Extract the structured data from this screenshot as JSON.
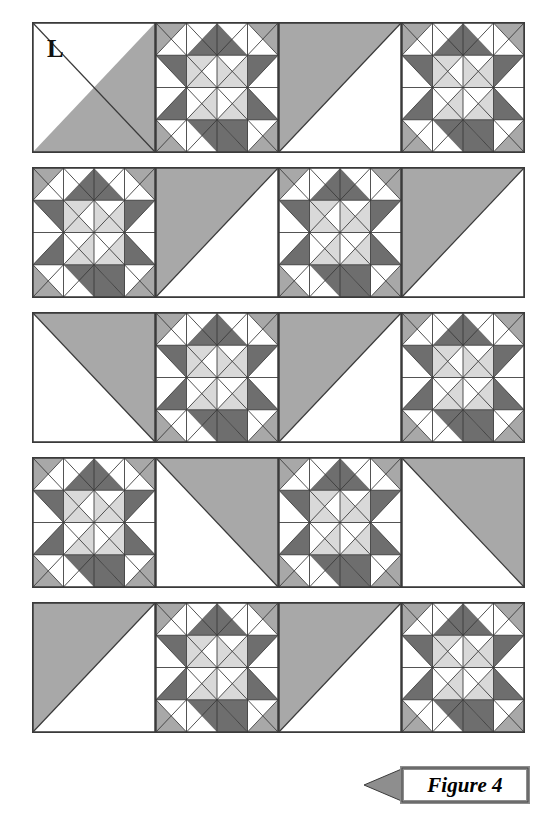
{
  "figure": {
    "caption": "Figure 4",
    "corner_label": "L",
    "banner_shape": "left-pointing-arrow-banner"
  },
  "palette": {
    "white": "#ffffff",
    "light_gray": "#d9d9d9",
    "medium_gray": "#a8a8a8",
    "dark_gray": "#6e6e6e",
    "outline": "#3a3a3a",
    "paper": "#ffffff",
    "ink": "#111111"
  },
  "quilt": {
    "rows": 5,
    "cells_per_row": 4,
    "cell_names": [
      "half-square-triangle-panel",
      "star-block"
    ],
    "layout": [
      [
        {
          "type": "triangle",
          "variant": "gray-bottom-left",
          "label": "L"
        },
        {
          "type": "star",
          "variant": "standard",
          "label": ""
        },
        {
          "type": "triangle",
          "variant": "gray-top-left",
          "label": ""
        },
        {
          "type": "star",
          "variant": "standard",
          "label": ""
        }
      ],
      [
        {
          "type": "star",
          "variant": "standard",
          "label": ""
        },
        {
          "type": "triangle",
          "variant": "gray-top-left",
          "label": ""
        },
        {
          "type": "star",
          "variant": "standard",
          "label": ""
        },
        {
          "type": "triangle",
          "variant": "gray-top-left",
          "label": ""
        }
      ],
      [
        {
          "type": "triangle",
          "variant": "gray-top-right",
          "label": ""
        },
        {
          "type": "star",
          "variant": "standard",
          "label": ""
        },
        {
          "type": "triangle",
          "variant": "gray-top-left",
          "label": ""
        },
        {
          "type": "star",
          "variant": "standard",
          "label": ""
        }
      ],
      [
        {
          "type": "star",
          "variant": "standard",
          "label": ""
        },
        {
          "type": "triangle",
          "variant": "gray-top-right",
          "label": ""
        },
        {
          "type": "star",
          "variant": "standard",
          "label": ""
        },
        {
          "type": "triangle",
          "variant": "gray-top-right",
          "label": ""
        }
      ],
      [
        {
          "type": "triangle",
          "variant": "gray-top-left",
          "label": ""
        },
        {
          "type": "star",
          "variant": "standard",
          "label": ""
        },
        {
          "type": "triangle",
          "variant": "gray-top-left",
          "label": ""
        },
        {
          "type": "star",
          "variant": "standard",
          "label": ""
        }
      ]
    ],
    "star_block": {
      "grid": "4x4",
      "corner_units": "half-square-triangle medium-gray over white",
      "edge_units": "quarter-square star points dark-gray with white",
      "center_units": "2x2 light-gray and white pinwheel"
    },
    "row_tops": [
      22,
      167,
      312,
      457,
      602
    ]
  }
}
